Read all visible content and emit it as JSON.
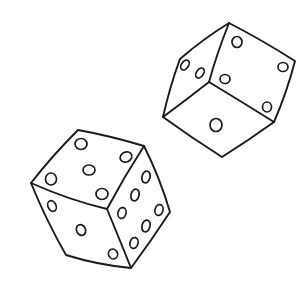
{
  "image": {
    "description": "Hand-drawn black line illustration of two tumbling dice on a white background",
    "colors": {
      "background": "#ffffff",
      "ink": "#1a1a1a"
    }
  },
  "dice": [
    {
      "name": "upper-right-die",
      "visible_faces": [
        {
          "face": "top-right",
          "pips": 3
        },
        {
          "face": "left",
          "pips": 2
        },
        {
          "face": "bottom",
          "pips": 1
        }
      ]
    },
    {
      "name": "lower-left-die",
      "visible_faces": [
        {
          "face": "top",
          "pips": 5
        },
        {
          "face": "left",
          "pips": 3
        },
        {
          "face": "right",
          "pips": 6
        }
      ]
    }
  ]
}
